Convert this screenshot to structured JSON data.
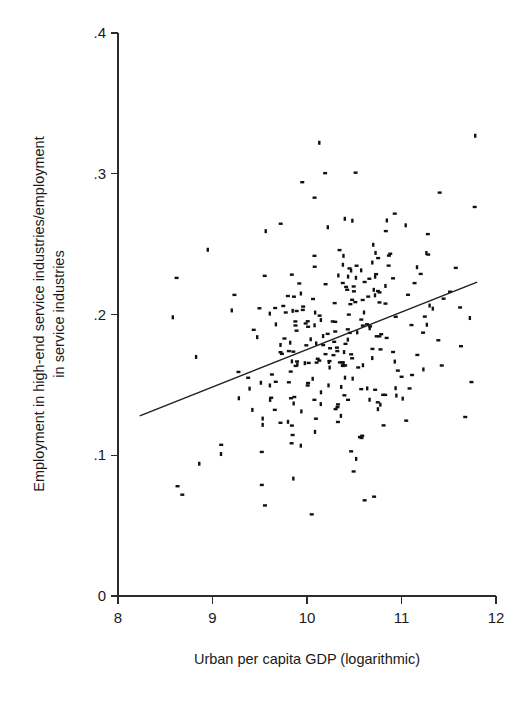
{
  "figure": {
    "background": "#ffffff",
    "ink_color": "#111111",
    "line_color": "#1f1f1f"
  },
  "chart_data": {
    "type": "scatter",
    "title": "",
    "subtitle": "",
    "xlabel": "Urban per capita GDP (logarithmic)",
    "ylabel": "Employment in high-end service industries/employment in service industries",
    "ylabel_lines": [
      "Employment in high-end service industries/employment",
      "in service industries"
    ],
    "xlim": [
      8,
      12
    ],
    "ylim": [
      0,
      0.4
    ],
    "xticks": [
      8,
      9,
      10,
      11,
      12
    ],
    "xtick_labels": [
      "8",
      "9",
      "10",
      "11",
      "12"
    ],
    "yticks": [
      0,
      0.1,
      0.2,
      0.3,
      0.4
    ],
    "ytick_labels": [
      "0",
      ".1",
      ".2",
      ".3",
      ".4"
    ],
    "grid": false,
    "legend": null,
    "legend_position": "none",
    "marker_style": "small-dash-rectangle",
    "marker_size_px": [
      4,
      2.4
    ],
    "n_points": 268,
    "point_cloud": {
      "x_mean": 10.32,
      "x_sd": 0.56,
      "x_min": 8.52,
      "x_max": 11.85,
      "y_mean": 0.178,
      "y_sd": 0.044,
      "y_min": 0.058,
      "y_max": 0.327,
      "correlation": 0.38,
      "seed": 20240517
    },
    "fit_line": {
      "label": "linear fit",
      "x_start": 8.23,
      "y_start": 0.128,
      "x_end": 11.8,
      "y_end": 0.223,
      "slope": 0.0266,
      "intercept": -0.0909
    },
    "outliers": [
      {
        "x": 11.78,
        "y": 0.327
      },
      {
        "x": 10.13,
        "y": 0.322
      },
      {
        "x": 9.95,
        "y": 0.294
      },
      {
        "x": 10.08,
        "y": 0.283
      },
      {
        "x": 10.4,
        "y": 0.268
      },
      {
        "x": 10.22,
        "y": 0.262
      },
      {
        "x": 8.95,
        "y": 0.246
      },
      {
        "x": 8.62,
        "y": 0.226
      },
      {
        "x": 8.58,
        "y": 0.198
      },
      {
        "x": 8.86,
        "y": 0.094
      },
      {
        "x": 8.63,
        "y": 0.078
      },
      {
        "x": 10.05,
        "y": 0.058
      },
      {
        "x": 11.74,
        "y": 0.152
      },
      {
        "x": 11.62,
        "y": 0.205
      }
    ]
  },
  "geometry": {
    "plot_left_px": 118,
    "plot_right_px": 496,
    "plot_top_px": 33,
    "plot_bottom_px": 596,
    "x_axis_y_px": 596,
    "y_axis_x_px": 118
  }
}
